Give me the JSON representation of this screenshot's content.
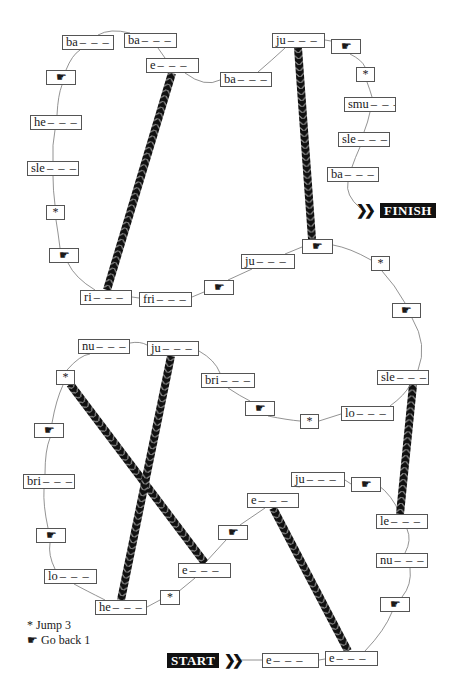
{
  "colors": {
    "ink": "#111111",
    "box_border": "#555555",
    "path": "#777777",
    "background": "#ffffff"
  },
  "labels": {
    "start": "START",
    "finish": "FINISH",
    "blank": "– – –"
  },
  "icons": {
    "jump": "*",
    "hand_back": "☛"
  },
  "legend": [
    {
      "symbol": "*",
      "text": "Jump 3"
    },
    {
      "symbol": "☛",
      "text": "Go back 1"
    }
  ],
  "squares": [
    {
      "id": "s1",
      "type": "word",
      "prefix": "e",
      "x": 262,
      "y": 653,
      "w": 57
    },
    {
      "id": "s2",
      "type": "word",
      "prefix": "e",
      "x": 325,
      "y": 651,
      "w": 53
    },
    {
      "id": "s3",
      "type": "icon",
      "icon": "hand",
      "x": 380,
      "y": 597,
      "w": 30
    },
    {
      "id": "s4",
      "type": "word",
      "prefix": "nu",
      "x": 376,
      "y": 553,
      "w": 52
    },
    {
      "id": "s5",
      "type": "word",
      "prefix": "le",
      "x": 376,
      "y": 514,
      "w": 52
    },
    {
      "id": "s6",
      "type": "icon",
      "icon": "hand",
      "x": 351,
      "y": 477,
      "w": 30
    },
    {
      "id": "s7",
      "type": "word",
      "prefix": "ju",
      "x": 291,
      "y": 472,
      "w": 54
    },
    {
      "id": "s8",
      "type": "word",
      "prefix": "e",
      "x": 247,
      "y": 493,
      "w": 52
    },
    {
      "id": "s9",
      "type": "icon",
      "icon": "hand",
      "x": 218,
      "y": 525,
      "w": 30
    },
    {
      "id": "s10",
      "type": "word",
      "prefix": "e",
      "x": 178,
      "y": 563,
      "w": 53
    },
    {
      "id": "s11",
      "type": "icon",
      "icon": "jump",
      "x": 160,
      "y": 590,
      "w": 20
    },
    {
      "id": "s12",
      "type": "word",
      "prefix": "he",
      "x": 95,
      "y": 600,
      "w": 52
    },
    {
      "id": "s13",
      "type": "word",
      "prefix": "lo",
      "x": 44,
      "y": 569,
      "w": 53
    },
    {
      "id": "s14",
      "type": "icon",
      "icon": "hand",
      "x": 36,
      "y": 528,
      "w": 30
    },
    {
      "id": "s15",
      "type": "word",
      "prefix": "bri",
      "x": 23,
      "y": 474,
      "w": 52
    },
    {
      "id": "s16",
      "type": "icon",
      "icon": "hand",
      "x": 34,
      "y": 423,
      "w": 30
    },
    {
      "id": "s17",
      "type": "icon",
      "icon": "jump",
      "x": 56,
      "y": 370,
      "w": 19
    },
    {
      "id": "s18",
      "type": "word",
      "prefix": "nu",
      "x": 78,
      "y": 339,
      "w": 52
    },
    {
      "id": "s19",
      "type": "word",
      "prefix": "ju",
      "x": 147,
      "y": 341,
      "w": 52
    },
    {
      "id": "s20",
      "type": "word",
      "prefix": "bri",
      "x": 201,
      "y": 373,
      "w": 54
    },
    {
      "id": "s21",
      "type": "icon",
      "icon": "hand",
      "x": 245,
      "y": 401,
      "w": 30
    },
    {
      "id": "s22",
      "type": "icon",
      "icon": "jump",
      "x": 300,
      "y": 414,
      "w": 19
    },
    {
      "id": "s23",
      "type": "word",
      "prefix": "lo",
      "x": 341,
      "y": 406,
      "w": 53
    },
    {
      "id": "s24",
      "type": "word",
      "prefix": "sle",
      "x": 377,
      "y": 370,
      "w": 52
    },
    {
      "id": "s25",
      "type": "icon",
      "icon": "hand",
      "x": 392,
      "y": 303,
      "w": 29
    },
    {
      "id": "s26",
      "type": "icon",
      "icon": "jump",
      "x": 371,
      "y": 256,
      "w": 19
    },
    {
      "id": "s27",
      "type": "icon",
      "icon": "hand",
      "x": 302,
      "y": 239,
      "w": 31
    },
    {
      "id": "s28",
      "type": "word",
      "prefix": "ju",
      "x": 241,
      "y": 254,
      "w": 54
    },
    {
      "id": "s29",
      "type": "icon",
      "icon": "hand",
      "x": 204,
      "y": 280,
      "w": 30
    },
    {
      "id": "s30",
      "type": "word",
      "prefix": "fri",
      "x": 139,
      "y": 292,
      "w": 53
    },
    {
      "id": "s31",
      "type": "word",
      "prefix": "ri",
      "x": 80,
      "y": 290,
      "w": 52
    },
    {
      "id": "s32",
      "type": "icon",
      "icon": "hand",
      "x": 49,
      "y": 248,
      "w": 30
    },
    {
      "id": "s33",
      "type": "icon",
      "icon": "jump",
      "x": 46,
      "y": 205,
      "w": 19
    },
    {
      "id": "s34",
      "type": "word",
      "prefix": "sle",
      "x": 27,
      "y": 161,
      "w": 52
    },
    {
      "id": "s35",
      "type": "word",
      "prefix": "he",
      "x": 30,
      "y": 115,
      "w": 52
    },
    {
      "id": "s36",
      "type": "icon",
      "icon": "hand",
      "x": 46,
      "y": 70,
      "w": 30
    },
    {
      "id": "s37",
      "type": "word",
      "prefix": "ba",
      "x": 62,
      "y": 35,
      "w": 52
    },
    {
      "id": "s38",
      "type": "word",
      "prefix": "ba",
      "x": 124,
      "y": 33,
      "w": 53
    },
    {
      "id": "s39",
      "type": "word",
      "prefix": "e",
      "x": 146,
      "y": 58,
      "w": 53
    },
    {
      "id": "s40",
      "type": "word",
      "prefix": "ba",
      "x": 220,
      "y": 72,
      "w": 52
    },
    {
      "id": "s41",
      "type": "word",
      "prefix": "ju",
      "x": 272,
      "y": 33,
      "w": 53
    },
    {
      "id": "s42",
      "type": "icon",
      "icon": "hand",
      "x": 331,
      "y": 39,
      "w": 30
    },
    {
      "id": "s43",
      "type": "icon",
      "icon": "jump",
      "x": 356,
      "y": 67,
      "w": 19
    },
    {
      "id": "s44",
      "type": "word",
      "prefix": "smu",
      "x": 344,
      "y": 97,
      "w": 52
    },
    {
      "id": "s45",
      "type": "word",
      "prefix": "sle",
      "x": 338,
      "y": 132,
      "w": 52
    },
    {
      "id": "s46",
      "type": "word",
      "prefix": "ba",
      "x": 327,
      "y": 167,
      "w": 52
    }
  ],
  "start_tag": {
    "x": 167,
    "y": 653
  },
  "finish_tag": {
    "x": 380,
    "y": 203
  },
  "ropes": [
    {
      "name": "rope-ri-to-e",
      "x1": 107,
      "y1": 290,
      "x2": 172,
      "y2": 73
    },
    {
      "name": "rope-ju-to-hand",
      "x1": 298,
      "y1": 48,
      "x2": 312,
      "y2": 239
    },
    {
      "name": "rope-le-to-sle",
      "x1": 400,
      "y1": 514,
      "x2": 413,
      "y2": 385
    },
    {
      "name": "rope-jump-to-e",
      "x1": 70,
      "y1": 384,
      "x2": 205,
      "y2": 563
    },
    {
      "name": "rope-ju-to-he",
      "x1": 171,
      "y1": 356,
      "x2": 121,
      "y2": 600
    },
    {
      "name": "rope-e-to-e",
      "x1": 273,
      "y1": 508,
      "x2": 348,
      "y2": 651
    }
  ]
}
